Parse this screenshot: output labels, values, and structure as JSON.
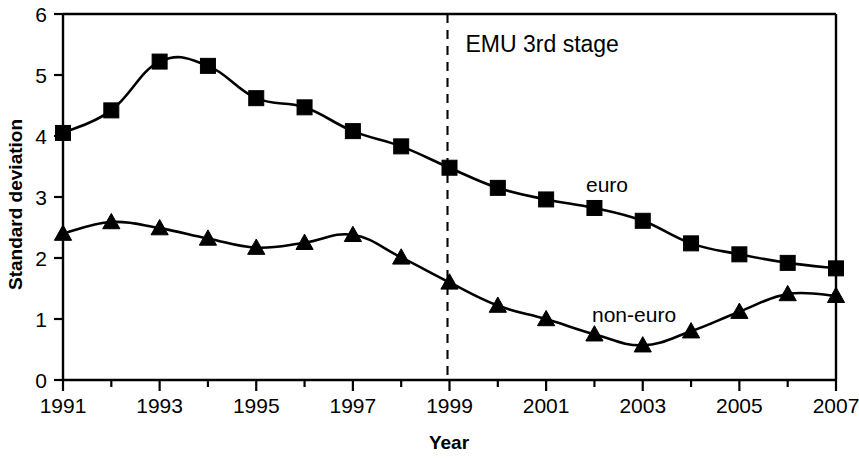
{
  "chart_data": {
    "type": "line",
    "title": "",
    "xlabel": "Year",
    "ylabel": "Standard deviation",
    "x": [
      1991,
      1992,
      1993,
      1994,
      1995,
      1996,
      1997,
      1998,
      1999,
      2000,
      2001,
      2002,
      2003,
      2004,
      2005,
      2006,
      2007
    ],
    "xlim": [
      1991,
      2007
    ],
    "ylim": [
      0,
      6
    ],
    "xticks": [
      1991,
      1992,
      1993,
      1994,
      1995,
      1996,
      1997,
      1998,
      1999,
      2000,
      2001,
      2002,
      2003,
      2004,
      2005,
      2006,
      2007
    ],
    "xticklabels": [
      "1991",
      "",
      "1993",
      "",
      "1995",
      "",
      "1997",
      "",
      "1999",
      "",
      "2001",
      "",
      "2003",
      "",
      "2005",
      "",
      "2007"
    ],
    "yticks": [
      0,
      1,
      2,
      3,
      4,
      5,
      6
    ],
    "yticklabels": [
      "0",
      "1",
      "2",
      "3",
      "4",
      "5",
      "6"
    ],
    "grid": false,
    "legend_position": "inline-labels",
    "series": [
      {
        "name": "euro",
        "marker": "square",
        "label": "euro",
        "values": [
          4.05,
          4.42,
          5.22,
          5.15,
          4.62,
          4.47,
          4.08,
          3.83,
          3.48,
          3.15,
          2.96,
          2.82,
          2.61,
          2.24,
          2.06,
          1.92,
          1.83
        ]
      },
      {
        "name": "non-euro",
        "marker": "triangle",
        "label": "non-euro",
        "values": [
          2.4,
          2.59,
          2.49,
          2.32,
          2.17,
          2.25,
          2.38,
          2.01,
          1.6,
          1.22,
          1.0,
          0.75,
          0.57,
          0.8,
          1.12,
          1.41,
          1.38
        ]
      }
    ],
    "annotations": [
      {
        "text": "EMU 3rd stage",
        "type": "vertical-line-label",
        "x": 1999,
        "line_style": "dashed"
      }
    ]
  },
  "axes": {
    "y_title": "Standard deviation",
    "x_title": "Year"
  },
  "labels": {
    "euro": "euro",
    "non_euro": "non-euro",
    "emu": "EMU 3rd stage"
  },
  "colors": {
    "foreground": "#000000",
    "background": "#ffffff"
  }
}
